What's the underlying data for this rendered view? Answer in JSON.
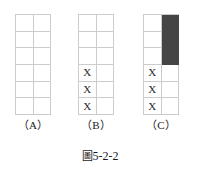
{
  "figure": {
    "caption_symbol": "圖",
    "caption_number": "5-2-2",
    "background_color": "#ffffff",
    "grid_line_color": "#cccccc",
    "fill_color": "#454545",
    "mark_glyph": "X",
    "rows": 6,
    "columns": 2,
    "panels": [
      {
        "id": "a",
        "label": "（A）",
        "cells": [
          {
            "row": 1,
            "col": 1,
            "state": "empty",
            "text": ""
          },
          {
            "row": 1,
            "col": 2,
            "state": "empty",
            "text": ""
          },
          {
            "row": 2,
            "col": 1,
            "state": "empty",
            "text": ""
          },
          {
            "row": 2,
            "col": 2,
            "state": "empty",
            "text": ""
          },
          {
            "row": 3,
            "col": 1,
            "state": "empty",
            "text": ""
          },
          {
            "row": 3,
            "col": 2,
            "state": "empty",
            "text": ""
          },
          {
            "row": 4,
            "col": 1,
            "state": "empty",
            "text": ""
          },
          {
            "row": 4,
            "col": 2,
            "state": "empty",
            "text": ""
          },
          {
            "row": 5,
            "col": 1,
            "state": "empty",
            "text": ""
          },
          {
            "row": 5,
            "col": 2,
            "state": "empty",
            "text": ""
          },
          {
            "row": 6,
            "col": 1,
            "state": "empty",
            "text": ""
          },
          {
            "row": 6,
            "col": 2,
            "state": "empty",
            "text": ""
          }
        ]
      },
      {
        "id": "b",
        "label": "（B）",
        "cells": [
          {
            "row": 1,
            "col": 1,
            "state": "empty",
            "text": ""
          },
          {
            "row": 1,
            "col": 2,
            "state": "empty",
            "text": ""
          },
          {
            "row": 2,
            "col": 1,
            "state": "empty",
            "text": ""
          },
          {
            "row": 2,
            "col": 2,
            "state": "empty",
            "text": ""
          },
          {
            "row": 3,
            "col": 1,
            "state": "empty",
            "text": ""
          },
          {
            "row": 3,
            "col": 2,
            "state": "empty",
            "text": ""
          },
          {
            "row": 4,
            "col": 1,
            "state": "marked",
            "text": "X"
          },
          {
            "row": 4,
            "col": 2,
            "state": "empty",
            "text": ""
          },
          {
            "row": 5,
            "col": 1,
            "state": "marked",
            "text": "X"
          },
          {
            "row": 5,
            "col": 2,
            "state": "empty",
            "text": ""
          },
          {
            "row": 6,
            "col": 1,
            "state": "marked",
            "text": "X"
          },
          {
            "row": 6,
            "col": 2,
            "state": "empty",
            "text": ""
          }
        ]
      },
      {
        "id": "c",
        "label": "（C）",
        "cells": [
          {
            "row": 1,
            "col": 1,
            "state": "empty",
            "text": ""
          },
          {
            "row": 1,
            "col": 2,
            "state": "filled",
            "text": ""
          },
          {
            "row": 2,
            "col": 1,
            "state": "empty",
            "text": ""
          },
          {
            "row": 2,
            "col": 2,
            "state": "filled",
            "text": ""
          },
          {
            "row": 3,
            "col": 1,
            "state": "empty",
            "text": ""
          },
          {
            "row": 3,
            "col": 2,
            "state": "filled",
            "text": ""
          },
          {
            "row": 4,
            "col": 1,
            "state": "marked",
            "text": "X"
          },
          {
            "row": 4,
            "col": 2,
            "state": "empty",
            "text": ""
          },
          {
            "row": 5,
            "col": 1,
            "state": "marked",
            "text": "X"
          },
          {
            "row": 5,
            "col": 2,
            "state": "empty",
            "text": ""
          },
          {
            "row": 6,
            "col": 1,
            "state": "marked",
            "text": "X"
          },
          {
            "row": 6,
            "col": 2,
            "state": "empty",
            "text": ""
          }
        ]
      }
    ]
  }
}
